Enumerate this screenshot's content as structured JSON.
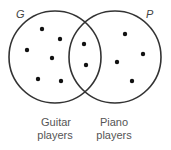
{
  "diagram": {
    "type": "venn",
    "colors": {
      "stroke": "#333333",
      "dot": "#111111",
      "label": "#444444",
      "caption": "#555555"
    },
    "sets": [
      {
        "id": "G",
        "letter": "G",
        "caption_line1": "Guitar",
        "caption_line2": "players",
        "center": [
          55,
          57
        ],
        "radius": 46
      },
      {
        "id": "P",
        "letter": "P",
        "caption_line1": "Piano",
        "caption_line2": "players",
        "center": [
          115,
          57
        ],
        "radius": 46
      }
    ],
    "regions": {
      "G_only": {
        "count": 6,
        "points": [
          [
            42,
            29
          ],
          [
            60,
            39
          ],
          [
            27,
            50
          ],
          [
            52,
            58
          ],
          [
            38,
            79
          ],
          [
            61,
            81
          ]
        ]
      },
      "G_and_P": {
        "count": 2,
        "points": [
          [
            84,
            44
          ],
          [
            86,
            65
          ]
        ]
      },
      "P_only": {
        "count": 4,
        "points": [
          [
            125,
            34
          ],
          [
            143,
            54
          ],
          [
            117,
            62
          ],
          [
            132,
            81
          ]
        ]
      }
    }
  }
}
